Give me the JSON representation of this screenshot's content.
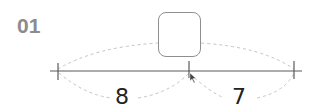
{
  "problem": {
    "number": "01"
  },
  "number_line": {
    "ticks": [
      "left",
      "middle",
      "right"
    ],
    "segments": [
      {
        "name": "left-segment",
        "length_label": "8"
      },
      {
        "name": "right-segment",
        "length_label": "7"
      }
    ],
    "total_box": {
      "value": "",
      "placeholder": ""
    }
  },
  "colors": {
    "label_gray": "#8c8c8c",
    "line": "#555555",
    "dashed_arc": "#bdbdbd",
    "box_border": "#8f8f8f",
    "text": "#222222"
  }
}
